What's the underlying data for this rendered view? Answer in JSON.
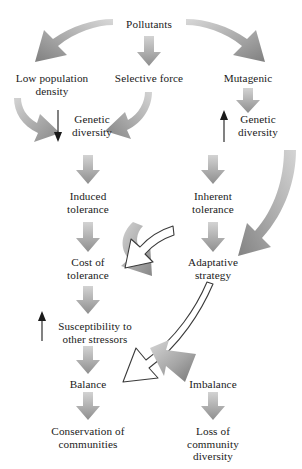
{
  "diagram": {
    "type": "flowchart",
    "colors": {
      "text": "#1a1a1a",
      "arrow_gray_light": "#cfcfcf",
      "arrow_gray_dark": "#8d8d8d",
      "arrow_outline": "#3a3a3a",
      "background": "#ffffff"
    },
    "nodes": [
      {
        "id": "pollutants",
        "label": "Pollutants",
        "x": 149,
        "y": 18
      },
      {
        "id": "low-population-density",
        "label": "Low population\ndensity",
        "x": 52,
        "y": 72
      },
      {
        "id": "selective-force",
        "label": "Selective force",
        "x": 149,
        "y": 72
      },
      {
        "id": "mutagenic",
        "label": "Mutagenic",
        "x": 248,
        "y": 72
      },
      {
        "id": "genetic-diversity-decrease",
        "label": "Genetic\ndiversity",
        "x": 92,
        "y": 113
      },
      {
        "id": "genetic-diversity-increase",
        "label": "Genetic\ndiversity",
        "x": 258,
        "y": 113
      },
      {
        "id": "induced-tolerance",
        "label": "Induced\ntolerance",
        "x": 88,
        "y": 190
      },
      {
        "id": "inherent-tolerance",
        "label": "Inherent\ntolerance",
        "x": 213,
        "y": 190
      },
      {
        "id": "cost-of-tolerance",
        "label": "Cost of\ntolerance",
        "x": 88,
        "y": 256
      },
      {
        "id": "adaptative-strategy",
        "label": "Adaptative\nstrategy",
        "x": 213,
        "y": 256
      },
      {
        "id": "susceptibility-other-stressors",
        "label": "Susceptibility to\nother stressors",
        "x": 95,
        "y": 320
      },
      {
        "id": "balance",
        "label": "Balance",
        "x": 88,
        "y": 378
      },
      {
        "id": "imbalance",
        "label": "Imbalance",
        "x": 213,
        "y": 378
      },
      {
        "id": "conservation-of-communities",
        "label": "Conservation of\ncommunities",
        "x": 88,
        "y": 425
      },
      {
        "id": "loss-of-community-diversity",
        "label": "Loss of\ncommunity diversity",
        "x": 213,
        "y": 425
      }
    ],
    "edges": [
      {
        "id": "pollutants-to-low-population-density",
        "style": "curved-gray",
        "from": "pollutants",
        "to": "low-population-density"
      },
      {
        "id": "pollutants-to-selective-force",
        "style": "straight-gray",
        "from": "pollutants",
        "to": "selective-force"
      },
      {
        "id": "pollutants-to-mutagenic",
        "style": "curved-gray",
        "from": "pollutants",
        "to": "mutagenic"
      },
      {
        "id": "low-population-density-to-genetic-diversity",
        "style": "curved-gray",
        "from": "low-population-density",
        "to": "genetic-diversity-decrease"
      },
      {
        "id": "selective-force-to-genetic-diversity",
        "style": "curved-gray",
        "from": "selective-force",
        "to": "genetic-diversity-decrease"
      },
      {
        "id": "mutagenic-to-genetic-diversity",
        "style": "straight-gray",
        "from": "mutagenic",
        "to": "genetic-diversity-increase"
      },
      {
        "id": "genetic-diversity-decrease-marker",
        "style": "thin-down",
        "from": "genetic-diversity-decrease",
        "to": "genetic-diversity-decrease"
      },
      {
        "id": "genetic-diversity-increase-marker",
        "style": "thin-up",
        "from": "genetic-diversity-increase",
        "to": "genetic-diversity-increase"
      },
      {
        "id": "genetic-diversity-to-induced-tolerance",
        "style": "straight-gray",
        "from": "genetic-diversity-decrease",
        "to": "induced-tolerance"
      },
      {
        "id": "genetic-diversity-to-inherent-tolerance",
        "style": "straight-gray",
        "from": "genetic-diversity-increase",
        "to": "inherent-tolerance"
      },
      {
        "id": "induced-tolerance-to-cost-of-tolerance",
        "style": "straight-gray",
        "from": "induced-tolerance",
        "to": "cost-of-tolerance"
      },
      {
        "id": "inherent-tolerance-to-adaptative-strategy",
        "style": "straight-gray",
        "from": "inherent-tolerance",
        "to": "adaptative-strategy"
      },
      {
        "id": "inherent-tolerance-sweep-to-adaptative-strategy",
        "style": "curved-gray-long",
        "from": "inherent-tolerance",
        "to": "adaptative-strategy"
      },
      {
        "id": "cost-of-tolerance-to-adaptative-strategy",
        "style": "curved-gray-loop",
        "from": "cost-of-tolerance",
        "to": "adaptative-strategy"
      },
      {
        "id": "adaptative-strategy-to-cost-of-tolerance",
        "style": "curved-outline",
        "from": "adaptative-strategy",
        "to": "cost-of-tolerance"
      },
      {
        "id": "cost-of-tolerance-to-susceptibility",
        "style": "straight-gray",
        "from": "cost-of-tolerance",
        "to": "susceptibility-other-stressors"
      },
      {
        "id": "susceptibility-increase-marker",
        "style": "thin-up",
        "from": "susceptibility-other-stressors",
        "to": "susceptibility-other-stressors"
      },
      {
        "id": "susceptibility-to-balance",
        "style": "straight-gray",
        "from": "susceptibility-other-stressors",
        "to": "balance"
      },
      {
        "id": "adaptative-strategy-to-balance",
        "style": "curved-outline-long",
        "from": "adaptative-strategy",
        "to": "balance"
      },
      {
        "id": "adaptative-strategy-to-imbalance",
        "style": "curved-gray-down",
        "from": "adaptative-strategy",
        "to": "imbalance"
      },
      {
        "id": "balance-to-conservation",
        "style": "straight-gray",
        "from": "balance",
        "to": "conservation-of-communities"
      },
      {
        "id": "imbalance-to-loss",
        "style": "straight-gray",
        "from": "imbalance",
        "to": "loss-of-community-diversity"
      }
    ]
  }
}
